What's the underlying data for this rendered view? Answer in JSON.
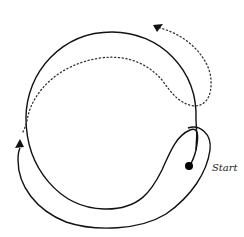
{
  "diagram": {
    "type": "path-around-circle",
    "labels": {
      "start": "Start"
    },
    "elements": {
      "circle": {
        "description": "large circular boundary",
        "color": "#111111"
      },
      "solid_path": {
        "description": "solid curved path from Start looping around bottom-left, arrow pointing up on left side",
        "color": "#111111"
      },
      "dotted_path": {
        "description": "dotted path continuing inside the circle and curving back up-right, arrow pointing up-left at top",
        "color": "#333333"
      },
      "start_point": {
        "description": "filled black dot marking start",
        "color": "#000000"
      }
    }
  }
}
